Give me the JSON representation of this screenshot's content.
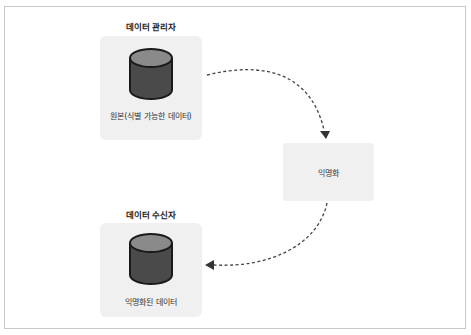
{
  "diagram": {
    "source": {
      "title": "데이터 관리자",
      "label": "원본(식별 가능한 데이터)"
    },
    "process": {
      "label": "익명화"
    },
    "target": {
      "title": "데이터 수신자",
      "label": "익명화된 데이터"
    },
    "colors": {
      "box_fill": "#f0f0f0",
      "cylinder_top": "#8a8a8a",
      "cylinder_body": "#4a4a4a",
      "cylinder_outline": "#1a1a1a",
      "arrow": "#444444",
      "frame_border": "#c8c8c8"
    }
  }
}
